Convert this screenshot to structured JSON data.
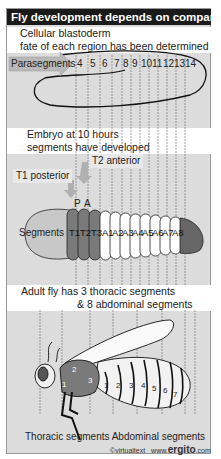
{
  "title": "Fly development depends on compartments",
  "panel1": {
    "caption_line1": "Cellular blastoderm",
    "caption_line2": "fate of each region has been determined",
    "arrow_label": "Parasegments",
    "parasegment_numbers": [
      "4",
      "5",
      "6",
      "7",
      "8",
      "9",
      "10",
      "11",
      "12",
      "13",
      "14"
    ]
  },
  "panel2": {
    "caption_line1": "Embryo at 10 hours",
    "caption_line2": "segments have developed",
    "t2_label": "T2 anterior",
    "t1_label": "T1 posterior",
    "p_label": "P",
    "a_label": "A",
    "segments_label": "Segments",
    "segments": [
      "T1",
      "T2",
      "T3",
      "A1",
      "A2",
      "A3",
      "A4",
      "A5",
      "A6",
      "A7",
      "A8"
    ]
  },
  "panel3": {
    "caption_line1": "Adult fly has 3 thoracic segments",
    "caption_line2": "& 8 abdominal segments",
    "thoracic_numbers": [
      "1",
      "2",
      "3"
    ],
    "abdominal_numbers": [
      "1",
      "2",
      "3",
      "4",
      "5",
      "6",
      "7"
    ],
    "bottom_label": "Thoracic segments Abdominal segments"
  },
  "footer": {
    "copyright": "©virtualtext",
    "url_prefix": "www.",
    "url_brand": "ergito",
    "url_suffix": ".com"
  },
  "colors": {
    "title_bg": "#1a1a1a",
    "panel_bg": "#dcdcdc",
    "thoracic": "#7a7a7a",
    "head": "#c8c8c8",
    "abdominal": "#ffffff"
  }
}
